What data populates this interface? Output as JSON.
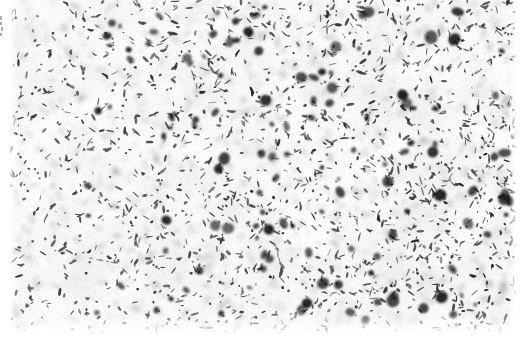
{
  "figure": {
    "kind": "micrograph",
    "caption": "",
    "width_px": 528,
    "height_px": 352,
    "background_color": "#ffffff",
    "plate": {
      "left_px": 10,
      "top_px": 0,
      "width_px": 506,
      "height_px": 338,
      "paper_color": "#fdfdfd",
      "particle_color": "#1a1a1a",
      "halo_color": "#9a9a9a"
    },
    "margins": {
      "left_px": 10,
      "right_px": 12,
      "bottom_px": 14,
      "top_px": 0,
      "color": "#ffffff"
    },
    "texture": {
      "description": "dense random field of small dark elongated particles on white",
      "particle_count": 2300,
      "particle_min_len_px": 2,
      "particle_max_len_px": 9,
      "particle_min_thick_px": 1,
      "particle_max_thick_px": 3,
      "density_gradient": "sparser at left, denser and darker toward right",
      "left_density_factor": 0.62,
      "right_density_factor": 1.0,
      "blur_px": 0.45,
      "seed": 20240917
    },
    "edge_artifacts": [
      {
        "left_px": 0,
        "top_px": 16,
        "width_px": 2,
        "height_px": 4
      },
      {
        "left_px": 0,
        "top_px": 22,
        "width_px": 2,
        "height_px": 3
      },
      {
        "left_px": 1,
        "top_px": 27,
        "width_px": 2,
        "height_px": 4
      },
      {
        "left_px": 0,
        "top_px": 33,
        "width_px": 2,
        "height_px": 3
      },
      {
        "left_px": 15,
        "top_px": 9,
        "width_px": 1,
        "height_px": 6
      }
    ]
  }
}
